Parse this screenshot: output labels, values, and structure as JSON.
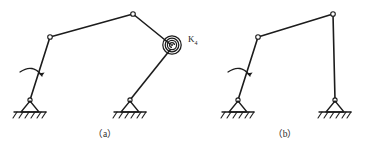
{
  "figure": {
    "background_color": "#ffffff",
    "line_color": "#1c1c1c",
    "panels": [
      {
        "id": "panel-a",
        "caption": "（a）",
        "description": "Four-bar linkage with spiral torsion spring at the coupler-rocker joint",
        "has_spring": true,
        "spring_label": "K",
        "spring_label_subscript": "4",
        "input_rotation_arrow": true,
        "joints": [
          {
            "name": "fixed-pivot-left",
            "x": 30,
            "y": 100
          },
          {
            "name": "moving-joint-upper-left",
            "x": 50,
            "y": 37
          },
          {
            "name": "moving-joint-top",
            "x": 133,
            "y": 14
          },
          {
            "name": "spring-joint-right",
            "x": 172,
            "y": 45
          },
          {
            "name": "fixed-pivot-right",
            "x": 130,
            "y": 100
          }
        ]
      },
      {
        "id": "panel-b",
        "caption": "（b）",
        "description": "Equivalent four-bar linkage without spring",
        "has_spring": false,
        "input_rotation_arrow": true,
        "joints": [
          {
            "name": "fixed-pivot-left",
            "x": 238,
            "y": 100
          },
          {
            "name": "moving-joint-upper-left",
            "x": 258,
            "y": 37
          },
          {
            "name": "moving-joint-top",
            "x": 333,
            "y": 14
          },
          {
            "name": "fixed-pivot-right",
            "x": 335,
            "y": 100
          }
        ]
      }
    ]
  }
}
